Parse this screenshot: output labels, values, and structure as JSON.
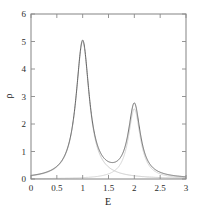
{
  "chart_data": {
    "type": "line",
    "title": "",
    "xlabel": "E",
    "ylabel": "ρ",
    "xlim": [
      0,
      3
    ],
    "ylim": [
      0,
      6
    ],
    "grid": false,
    "legend": "none",
    "xticks": [
      0,
      0.5,
      1,
      1.5,
      2,
      2.5,
      3
    ],
    "xtick_labels": [
      "0",
      "0.5",
      "1",
      "1.5",
      "2",
      "2.5",
      "3"
    ],
    "yticks": [
      0,
      1,
      2,
      3,
      4,
      5,
      6
    ],
    "ytick_labels": [
      "0",
      "1",
      "2",
      "3",
      "4",
      "5",
      "6"
    ],
    "series": [
      {
        "name": "total",
        "style": "solid",
        "color": "#5a5a5a",
        "peaks": [
          {
            "center": 1.0,
            "height": 5.0,
            "hwhm": 0.155
          },
          {
            "center": 2.0,
            "height": 2.65,
            "hwhm": 0.14
          }
        ],
        "annotations": [
          {
            "label": "peak-1",
            "x": 1.0,
            "y": 5.0
          },
          {
            "label": "peak-2",
            "x": 2.0,
            "y": 2.65
          },
          {
            "label": "minimum",
            "x": 1.55,
            "y": 0.95
          }
        ]
      },
      {
        "name": "component-1",
        "style": "solid-faint",
        "color": "#bdbdbd",
        "peaks": [
          {
            "center": 1.0,
            "height": 5.0,
            "hwhm": 0.155
          }
        ]
      },
      {
        "name": "component-2",
        "style": "solid-faint",
        "color": "#c8c8c8",
        "peaks": [
          {
            "center": 2.0,
            "height": 2.55,
            "hwhm": 0.14
          }
        ]
      }
    ]
  },
  "axes": {
    "frame_color": "#8a8a8a",
    "tick_color": "#8a8a8a"
  }
}
